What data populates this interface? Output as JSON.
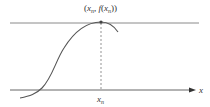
{
  "diagram": {
    "point_label": {
      "open": "(",
      "x": "x",
      "x_sub": "n",
      "comma": ", ",
      "f": "f",
      "paren_open": "(",
      "x2": "x",
      "x2_sub": "n",
      "close": "))"
    },
    "axis_label": "x",
    "tick_label": {
      "x": "x",
      "sub": "n"
    },
    "colors": {
      "curve": "#555555",
      "axis": "#555555",
      "tangent": "#888888",
      "dashed": "#666666"
    }
  }
}
